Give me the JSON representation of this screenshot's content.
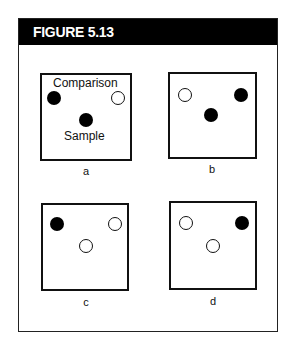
{
  "figure": {
    "title": "FIGURE 5.13"
  },
  "panels": [
    {
      "id": "a",
      "caption": "a",
      "labels": {
        "top": "Comparison",
        "bottom": "Sample"
      },
      "left_stimulus": "filled",
      "right_stimulus": "open",
      "sample": "filled"
    },
    {
      "id": "b",
      "caption": "b",
      "left_stimulus": "open",
      "right_stimulus": "filled",
      "sample": "filled"
    },
    {
      "id": "c",
      "caption": "c",
      "left_stimulus": "filled",
      "right_stimulus": "open",
      "sample": "open"
    },
    {
      "id": "d",
      "caption": "d",
      "left_stimulus": "open",
      "right_stimulus": "filled",
      "sample": "open"
    }
  ]
}
